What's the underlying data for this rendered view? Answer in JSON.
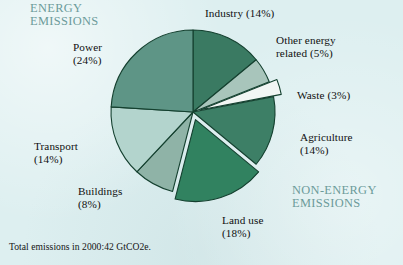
{
  "figure": {
    "background_color": "#ddeff0",
    "footnote": "Total emissions in 2000:42 GtCO2e.",
    "section_labels": {
      "energy": "ENERGY\nEMISSIONS",
      "non_energy": "NON-ENERGY\nEMISSIONS",
      "color": "#6c9b9a"
    }
  },
  "labels": {
    "industry": "Industry (14%)",
    "other_energy": "Other energy\nrelated (5%)",
    "waste": "Waste (3%)",
    "agriculture": "Agriculture\n(14%)",
    "land_use": "Land use\n(18%)",
    "buildings": "Buildings\n(8%)",
    "transport": "Transport\n(14%)",
    "power": "Power\n(24%)"
  },
  "chart_data": {
    "type": "pie",
    "title": "",
    "subtitle": "",
    "xlabel": "",
    "ylabel": "",
    "units": "percent of total greenhouse gas emissions",
    "total_note": "Total emissions in 2000:42 GtCO2e.",
    "total_value": 42,
    "total_units": "GtCO2e",
    "year": 2000,
    "legend": "none (direct slice labels)",
    "grid": false,
    "start_angle_deg": 0,
    "direction": "clockwise",
    "categories": [
      "Industry",
      "Other energy related",
      "Waste",
      "Agriculture",
      "Land use",
      "Buildings",
      "Transport",
      "Power"
    ],
    "values": [
      14,
      5,
      3,
      14,
      18,
      8,
      14,
      24
    ],
    "colors": [
      "#3a7a62",
      "#a8c5bb",
      "#f2f6f4",
      "#3d7f66",
      "#318260",
      "#8fb3a7",
      "#b3d4cd",
      "#5e9586"
    ],
    "exploded": [
      "Waste",
      "Land use"
    ],
    "groups": {
      "energy_emissions": [
        "Power",
        "Transport",
        "Buildings",
        "Industry",
        "Other energy related"
      ],
      "non_energy_emissions": [
        "Waste",
        "Agriculture",
        "Land use"
      ]
    },
    "slices": [
      {
        "label": "Industry",
        "value": 14,
        "display": "Industry (14%)",
        "color": "#3a7a62",
        "group": "energy"
      },
      {
        "label": "Other energy related",
        "value": 5,
        "display": "Other energy related (5%)",
        "color": "#a8c5bb",
        "group": "energy"
      },
      {
        "label": "Waste",
        "value": 3,
        "display": "Waste (3%)",
        "color": "#f2f6f4",
        "group": "non-energy",
        "exploded": true
      },
      {
        "label": "Agriculture",
        "value": 14,
        "display": "Agriculture (14%)",
        "color": "#3d7f66",
        "group": "non-energy"
      },
      {
        "label": "Land use",
        "value": 18,
        "display": "Land use (18%)",
        "color": "#318260",
        "group": "non-energy",
        "exploded": true
      },
      {
        "label": "Buildings",
        "value": 8,
        "display": "Buildings (8%)",
        "color": "#8fb3a7",
        "group": "energy"
      },
      {
        "label": "Transport",
        "value": 14,
        "display": "Transport (14%)",
        "color": "#b3d4cd",
        "group": "energy"
      },
      {
        "label": "Power",
        "value": 24,
        "display": "Power (24%)",
        "color": "#5e9586",
        "group": "energy"
      }
    ]
  }
}
